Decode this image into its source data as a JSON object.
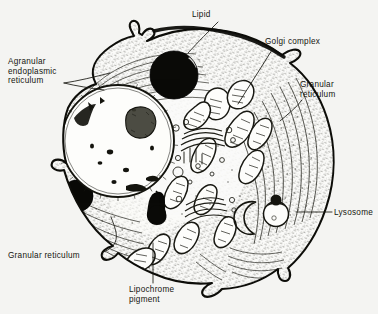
{
  "figure": {
    "background_color": "#f4f4f2",
    "ink_color": "#15150f",
    "width": 378,
    "height": 314
  },
  "labels": [
    {
      "id": "lipid",
      "name": "label-lipid",
      "lines": [
        "Lipid"
      ],
      "x": 192,
      "y": 10,
      "align": "left",
      "leader": [
        [
          218,
          22
        ],
        [
          200,
          40
        ],
        [
          188,
          52
        ]
      ],
      "points_to": "lipid-droplet-upper"
    },
    {
      "id": "golgi-complex",
      "name": "label-golgi-complex",
      "lines": [
        "Golgi complex"
      ],
      "x": 265,
      "y": 37,
      "align": "left",
      "leader": [
        [
          272,
          50
        ],
        [
          252,
          80
        ],
        [
          238,
          104
        ]
      ],
      "points_to": "golgi-apparatus"
    },
    {
      "id": "agranular-endoplasmic-reticulum",
      "name": "label-agranular-endoplasmic-reticulum",
      "lines": [
        "Agranular",
        "endoplasmic",
        "reticulum"
      ],
      "x": 8,
      "y": 57,
      "align": "left",
      "leader": [
        [
          64,
          83
        ],
        [
          88,
          78
        ],
        [
          110,
          73
        ]
      ],
      "points_to": "agranular-er-region"
    },
    {
      "id": "granular-reticulum-right",
      "name": "label-granular-reticulum-right",
      "lines": [
        "Granular",
        "reticulum"
      ],
      "x": 300,
      "y": 80,
      "align": "left",
      "leader": [
        [
          302,
          100
        ],
        [
          292,
          110
        ],
        [
          280,
          120
        ]
      ],
      "points_to": "granular-er-right-region"
    },
    {
      "id": "lysosome",
      "name": "label-lysosome",
      "lines": [
        "Lysosome"
      ],
      "x": 334,
      "y": 208,
      "align": "left",
      "leader": [
        [
          332,
          212
        ],
        [
          298,
          212
        ]
      ],
      "points_to": "lysosome-body"
    },
    {
      "id": "granular-reticulum-left",
      "name": "label-granular-reticulum-left",
      "lines": [
        "Granular reticulum"
      ],
      "x": 8,
      "y": 251,
      "align": "left",
      "leader": [
        [
          103,
          252
        ],
        [
          118,
          244
        ],
        [
          111,
          218
        ]
      ],
      "points_to": "granular-er-left-region"
    },
    {
      "id": "lipochrome-pigment",
      "name": "label-lipochrome-pigment",
      "lines": [
        "Lipochrome",
        "pigment"
      ],
      "x": 129,
      "y": 285,
      "align": "left",
      "leader": [
        [
          153,
          283
        ],
        [
          153,
          244
        ]
      ],
      "points_to": "lipochrome-granule"
    }
  ],
  "organelles": {
    "nucleus": {
      "name": "nucleus",
      "cx": 118,
      "cy": 141,
      "r": 57
    },
    "nucleolus": {
      "name": "nucleolus",
      "cx": 140,
      "cy": 123,
      "r": 14
    },
    "lipid_droplet_upper": {
      "name": "lipid-droplet-upper",
      "cx": 174,
      "cy": 75,
      "r": 24
    },
    "lipid_droplet_lower": {
      "name": "lipid-droplet-lower",
      "cx": 77,
      "cy": 196,
      "r": 16
    },
    "lipochrome_granule": {
      "name": "lipochrome-granule",
      "cx": 157,
      "cy": 208,
      "r": 10
    },
    "lysosome": {
      "name": "lysosome-body",
      "cx": 276,
      "cy": 214,
      "r": 13
    }
  }
}
